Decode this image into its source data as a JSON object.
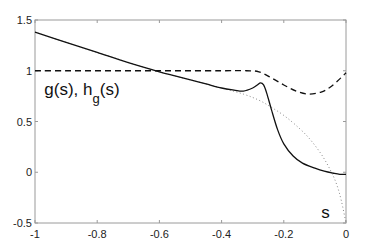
{
  "chart_data": {
    "type": "line",
    "title": "",
    "xlabel": "s",
    "ylabel": "",
    "xlim": [
      -1,
      0
    ],
    "ylim": [
      -0.5,
      1.5
    ],
    "grid": false,
    "legend": null,
    "x_ticks": [
      -1,
      -0.8,
      -0.6,
      -0.4,
      -0.2,
      0
    ],
    "x_tick_labels": [
      "-1",
      "-0.8",
      "-0.6",
      "-0.4",
      "-0.2",
      "0"
    ],
    "y_ticks": [
      -0.5,
      0,
      0.5,
      1,
      1.5
    ],
    "y_tick_labels": [
      "-0.5",
      "0",
      "0.5",
      "1",
      "1.5"
    ],
    "annotations": [
      {
        "text": "g(s), h",
        "sub": "g",
        "suffix": "(s)",
        "x": -0.97,
        "y": 0.82
      },
      {
        "text": "s",
        "x": -0.06,
        "y": -0.37
      }
    ],
    "series": [
      {
        "name": "g(s)",
        "style": "solid",
        "color": "#111111",
        "x": [
          -1,
          -0.9,
          -0.8,
          -0.7,
          -0.6,
          -0.55,
          -0.5,
          -0.45,
          -0.4,
          -0.36,
          -0.33,
          -0.3,
          -0.285,
          -0.275,
          -0.265,
          -0.255,
          -0.24,
          -0.22,
          -0.2,
          -0.17,
          -0.14,
          -0.1,
          -0.07,
          -0.04,
          -0.02,
          0
        ],
        "y": [
          1.38,
          1.28,
          1.18,
          1.08,
          0.99,
          0.95,
          0.91,
          0.87,
          0.83,
          0.81,
          0.8,
          0.83,
          0.86,
          0.88,
          0.86,
          0.78,
          0.62,
          0.42,
          0.28,
          0.16,
          0.09,
          0.04,
          0.01,
          -0.01,
          -0.02,
          -0.02
        ]
      },
      {
        "name": "h_g(s)",
        "style": "dashed",
        "color": "#111111",
        "x": [
          -1,
          -0.9,
          -0.8,
          -0.7,
          -0.6,
          -0.5,
          -0.4,
          -0.32,
          -0.28,
          -0.24,
          -0.2,
          -0.16,
          -0.12,
          -0.08,
          -0.05,
          -0.02,
          0
        ],
        "y": [
          1.0,
          1.0,
          1.0,
          1.0,
          1.0,
          1.0,
          1.0,
          1.0,
          0.99,
          0.93,
          0.86,
          0.8,
          0.77,
          0.79,
          0.84,
          0.92,
          0.98
        ]
      },
      {
        "name": "asymptotic",
        "style": "dotted",
        "color": "#888888",
        "x": [
          -1,
          -0.8,
          -0.6,
          -0.5,
          -0.4,
          -0.33,
          -0.28,
          -0.24,
          -0.2,
          -0.16,
          -0.12,
          -0.08,
          -0.05,
          -0.03,
          -0.015,
          0
        ],
        "y": [
          1.38,
          1.18,
          0.99,
          0.91,
          0.83,
          0.77,
          0.71,
          0.64,
          0.56,
          0.46,
          0.34,
          0.18,
          0.02,
          -0.12,
          -0.28,
          -0.5
        ]
      }
    ]
  }
}
